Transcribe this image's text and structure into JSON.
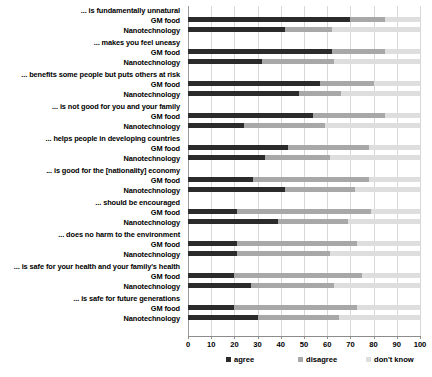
{
  "chart_data": {
    "type": "bar",
    "orientation": "horizontal",
    "stacked": true,
    "title": "",
    "subtitle": "",
    "xlabel": "",
    "ylabel": "",
    "xlim": [
      0,
      100
    ],
    "xticks": [
      0,
      10,
      20,
      30,
      40,
      50,
      60,
      70,
      80,
      90,
      100
    ],
    "grid": true,
    "grid_axis": "x",
    "legend_position": "bottom",
    "legend": [
      "agree",
      "disagree",
      "don't know"
    ],
    "series_names": [
      "GM food",
      "Nanotechnology"
    ],
    "colors": {
      "agree": "#2b2b2b",
      "disagree": "#a8a8a8",
      "dont_know": "#dedede",
      "gridline": "#d8d8d8",
      "axis": "#8c8c8c",
      "text": "#000000",
      "background": "#ffffff"
    },
    "categories": [
      "... is fundamentally unnatural",
      "... makes you feel uneasy",
      "... benefits some people but puts others at risk",
      "... is not good for you and your family",
      "... helps people in developing countries",
      "... is good for the [nationality] economy",
      "... should be encouraged",
      "... does no harm to the environment",
      "... is safe for your health and your family's health",
      "... is safe for future generations"
    ],
    "groups": [
      {
        "category": "... is fundamentally unnatural",
        "rows": [
          {
            "name": "GM food",
            "agree": 70,
            "disagree": 15,
            "dont_know": 15
          },
          {
            "name": "Nanotechnology",
            "agree": 42,
            "disagree": 20,
            "dont_know": 38
          }
        ]
      },
      {
        "category": "... makes you feel uneasy",
        "rows": [
          {
            "name": "GM food",
            "agree": 62,
            "disagree": 23,
            "dont_know": 15
          },
          {
            "name": "Nanotechnology",
            "agree": 32,
            "disagree": 31,
            "dont_know": 37
          }
        ]
      },
      {
        "category": "... benefits some people but puts others at risk",
        "rows": [
          {
            "name": "GM food",
            "agree": 57,
            "disagree": 23,
            "dont_know": 20
          },
          {
            "name": "Nanotechnology",
            "agree": 48,
            "disagree": 18,
            "dont_know": 34
          }
        ]
      },
      {
        "category": "... is not good for you and your family",
        "rows": [
          {
            "name": "GM food",
            "agree": 54,
            "disagree": 31,
            "dont_know": 15
          },
          {
            "name": "Nanotechnology",
            "agree": 24,
            "disagree": 35,
            "dont_know": 41
          }
        ]
      },
      {
        "category": "... helps people in developing countries",
        "rows": [
          {
            "name": "GM food",
            "agree": 43,
            "disagree": 35,
            "dont_know": 22
          },
          {
            "name": "Nanotechnology",
            "agree": 33,
            "disagree": 28,
            "dont_know": 39
          }
        ]
      },
      {
        "category": "... is good for the [nationality] economy",
        "rows": [
          {
            "name": "GM food",
            "agree": 28,
            "disagree": 50,
            "dont_know": 22
          },
          {
            "name": "Nanotechnology",
            "agree": 42,
            "disagree": 30,
            "dont_know": 28
          }
        ]
      },
      {
        "category": "... should be encouraged",
        "rows": [
          {
            "name": "GM food",
            "agree": 21,
            "disagree": 58,
            "dont_know": 21
          },
          {
            "name": "Nanotechnology",
            "agree": 39,
            "disagree": 30,
            "dont_know": 31
          }
        ]
      },
      {
        "category": "... does no harm to the environment",
        "rows": [
          {
            "name": "GM food",
            "agree": 21,
            "disagree": 52,
            "dont_know": 27
          },
          {
            "name": "Nanotechnology",
            "agree": 21,
            "disagree": 40,
            "dont_know": 39
          }
        ]
      },
      {
        "category": "... is safe for your health and your family's health",
        "rows": [
          {
            "name": "GM food",
            "agree": 20,
            "disagree": 55,
            "dont_know": 25
          },
          {
            "name": "Nanotechnology",
            "agree": 27,
            "disagree": 36,
            "dont_know": 37
          }
        ]
      },
      {
        "category": "... is safe for future generations",
        "rows": [
          {
            "name": "GM food",
            "agree": 20,
            "disagree": 53,
            "dont_know": 27
          },
          {
            "name": "Nanotechnology",
            "agree": 30,
            "disagree": 35,
            "dont_know": 35
          }
        ]
      }
    ]
  }
}
